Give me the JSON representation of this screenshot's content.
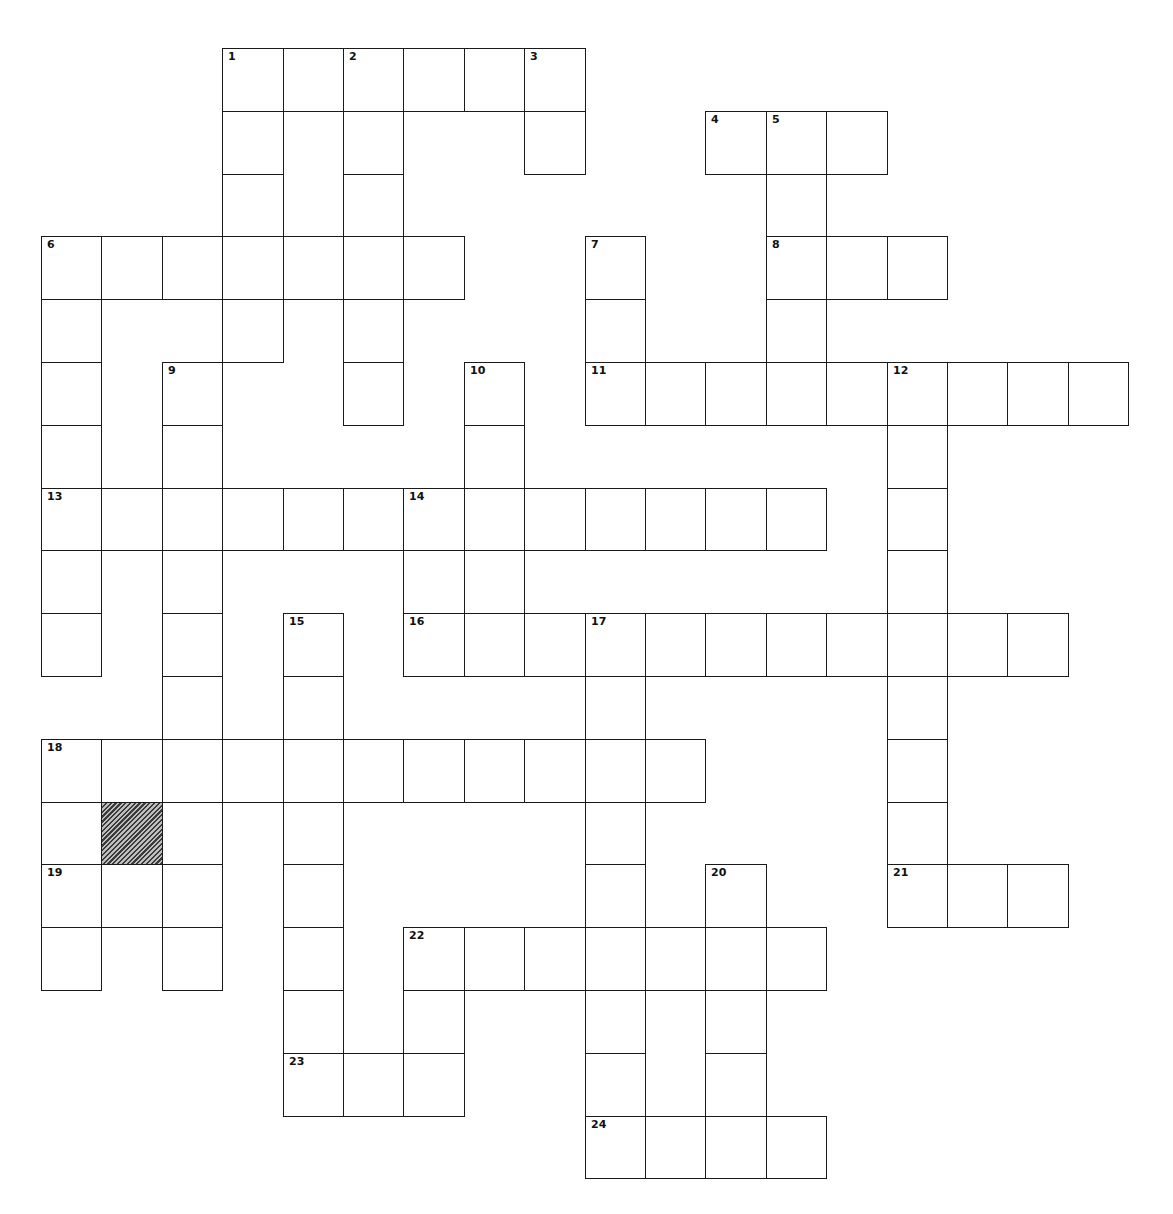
{
  "puzzle": {
    "type": "crossword",
    "grid": {
      "rows": 18,
      "cols": 19,
      "origin_x": 41,
      "origin_y": 48,
      "cell_w": 60.4,
      "cell_h": 62.8,
      "line_color": "#1a1a1a",
      "background": "#ffffff"
    },
    "blocked_cells": [
      {
        "row": 12,
        "col": 1,
        "style": "hatched"
      }
    ],
    "entries": [
      {
        "number": 1,
        "direction": "across",
        "row": 0,
        "col": 3,
        "length": 6
      },
      {
        "number": 1,
        "direction": "down",
        "row": 0,
        "col": 3,
        "length": 5
      },
      {
        "number": 2,
        "direction": "down",
        "row": 0,
        "col": 5,
        "length": 6
      },
      {
        "number": 3,
        "direction": "down",
        "row": 0,
        "col": 8,
        "length": 2
      },
      {
        "number": 4,
        "direction": "across",
        "row": 1,
        "col": 11,
        "length": 3
      },
      {
        "number": 5,
        "direction": "down",
        "row": 1,
        "col": 12,
        "length": 5
      },
      {
        "number": 6,
        "direction": "across",
        "row": 3,
        "col": 0,
        "length": 7
      },
      {
        "number": 6,
        "direction": "down",
        "row": 3,
        "col": 0,
        "length": 7
      },
      {
        "number": 7,
        "direction": "down",
        "row": 3,
        "col": 9,
        "length": 3
      },
      {
        "number": 8,
        "direction": "across",
        "row": 3,
        "col": 12,
        "length": 3
      },
      {
        "number": 9,
        "direction": "down",
        "row": 5,
        "col": 2,
        "length": 10
      },
      {
        "number": 10,
        "direction": "down",
        "row": 5,
        "col": 7,
        "length": 5
      },
      {
        "number": 11,
        "direction": "across",
        "row": 5,
        "col": 9,
        "length": 9
      },
      {
        "number": 12,
        "direction": "down",
        "row": 5,
        "col": 14,
        "length": 9
      },
      {
        "number": 13,
        "direction": "across",
        "row": 7,
        "col": 0,
        "length": 13
      },
      {
        "number": 14,
        "direction": "down",
        "row": 7,
        "col": 6,
        "length": 3
      },
      {
        "number": 15,
        "direction": "down",
        "row": 9,
        "col": 4,
        "length": 8
      },
      {
        "number": 16,
        "direction": "across",
        "row": 9,
        "col": 6,
        "length": 11
      },
      {
        "number": 17,
        "direction": "down",
        "row": 9,
        "col": 9,
        "length": 9
      },
      {
        "number": 18,
        "direction": "across",
        "row": 11,
        "col": 0,
        "length": 11
      },
      {
        "number": 18,
        "direction": "down",
        "row": 11,
        "col": 0,
        "length": 4
      },
      {
        "number": 19,
        "direction": "across",
        "row": 13,
        "col": 0,
        "length": 3
      },
      {
        "number": 20,
        "direction": "down",
        "row": 13,
        "col": 11,
        "length": 5
      },
      {
        "number": 21,
        "direction": "across",
        "row": 13,
        "col": 14,
        "length": 3
      },
      {
        "number": 22,
        "direction": "across",
        "row": 14,
        "col": 6,
        "length": 7
      },
      {
        "number": 22,
        "direction": "down",
        "row": 14,
        "col": 6,
        "length": 3
      },
      {
        "number": 23,
        "direction": "across",
        "row": 16,
        "col": 4,
        "length": 3
      },
      {
        "number": 24,
        "direction": "across",
        "row": 17,
        "col": 9,
        "length": 4
      }
    ],
    "extra_cells": [
      {
        "row": 13,
        "col": 1
      }
    ],
    "answers": {}
  }
}
